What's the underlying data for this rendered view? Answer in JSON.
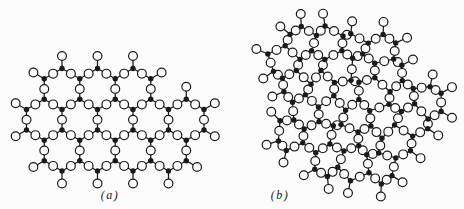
{
  "figure": {
    "background": "#fcfcfc",
    "ink": "#1a1a1a",
    "style": {
      "oxygen_radius": 4.4,
      "cation_radius": 2.7,
      "bond_width": 1.25,
      "circle_stroke": 1.2,
      "terminal_bond": 12.5
    },
    "panels": [
      {
        "id": "a",
        "label": "(a)",
        "kind": "ordered-crystalline-network",
        "side": 20.5,
        "rotation": 0,
        "jitter": 0,
        "rows": [
          {
            "y": 89,
            "x": [
              62,
              97.5,
              133
            ]
          },
          {
            "y": 119.75,
            "x": [
              44.25,
              79.75,
              115.25,
              150.75,
              186.25
            ]
          },
          {
            "y": 150.5,
            "x": [
              62,
              97.5,
              133,
              168.5
            ]
          }
        ]
      },
      {
        "id": "b",
        "label": "(b)",
        "kind": "random-glass-network",
        "side": 20,
        "rotation": 6,
        "jitter": 5,
        "fit": [
          246,
          10,
          463,
          200
        ],
        "rows": [
          {
            "y": 0,
            "x": [
              17.32,
              51.96,
              86.6,
              121.24
            ]
          },
          {
            "y": 30,
            "x": [
              0,
              34.64,
              69.28,
              103.92,
              138.56
            ]
          },
          {
            "y": 60,
            "x": [
              17.32,
              51.96,
              86.6,
              121.24,
              155.88,
              190.52
            ]
          },
          {
            "y": 90,
            "x": [
              34.64,
              69.28,
              103.92,
              138.56,
              173.2
            ]
          },
          {
            "y": 120,
            "x": [
              17.32,
              51.96,
              86.6,
              121.24,
              155.88
            ]
          },
          {
            "y": 150,
            "x": [
              69.28,
              103.92,
              138.56
            ]
          }
        ]
      }
    ]
  }
}
